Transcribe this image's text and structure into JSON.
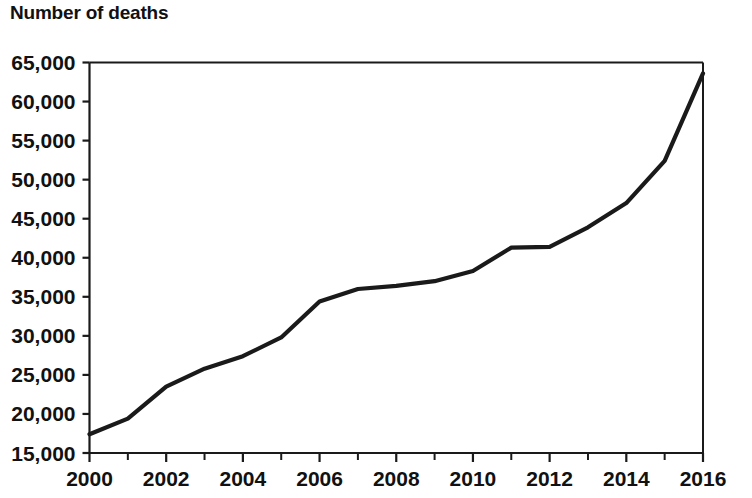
{
  "chart_data": {
    "type": "line",
    "title": "Number of deaths",
    "xlabel": "",
    "ylabel": "",
    "x": [
      2000,
      2001,
      2002,
      2003,
      2004,
      2005,
      2006,
      2007,
      2008,
      2009,
      2010,
      2011,
      2012,
      2013,
      2014,
      2015,
      2016
    ],
    "values": [
      17400,
      19400,
      23500,
      25800,
      27400,
      29800,
      34400,
      36000,
      36400,
      37000,
      38300,
      41300,
      41400,
      43900,
      47000,
      52400,
      63600
    ],
    "series": [
      {
        "name": "Number of deaths",
        "values": [
          17400,
          19400,
          23500,
          25800,
          27400,
          29800,
          34400,
          36000,
          36400,
          37000,
          38300,
          41300,
          41400,
          43900,
          47000,
          52400,
          63600
        ]
      }
    ],
    "xlim": [
      2000,
      2016
    ],
    "ylim": [
      15000,
      65000
    ],
    "y_ticks": [
      15000,
      20000,
      25000,
      30000,
      35000,
      40000,
      45000,
      50000,
      55000,
      60000,
      65000
    ],
    "y_tick_labels": [
      "15,000",
      "20,000",
      "25,000",
      "30,000",
      "35,000",
      "40,000",
      "45,000",
      "50,000",
      "55,000",
      "60,000",
      "65,000"
    ],
    "x_ticks": [
      2000,
      2002,
      2004,
      2006,
      2008,
      2010,
      2012,
      2014,
      2016
    ],
    "x_tick_labels": [
      "2000",
      "2002",
      "2004",
      "2006",
      "2008",
      "2010",
      "2012",
      "2014",
      "2016"
    ],
    "x_minor_ticks": [
      2001,
      2003,
      2005,
      2007,
      2009,
      2011,
      2013,
      2015
    ],
    "grid": false,
    "legend": false,
    "legend_position": "none",
    "line_color": "#1a1a1a",
    "background_color": "#ffffff"
  }
}
